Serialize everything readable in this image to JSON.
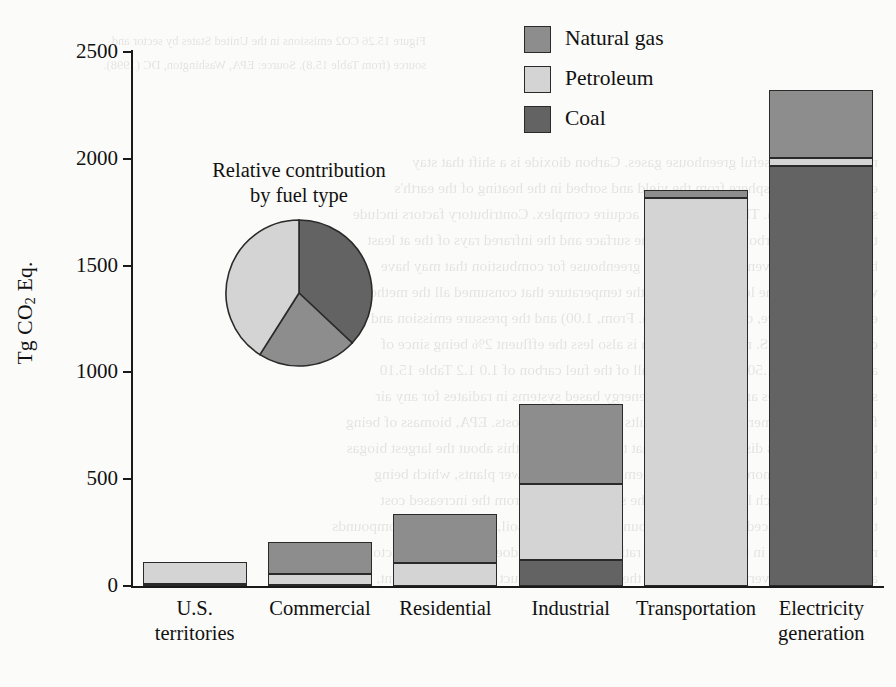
{
  "chart_data": {
    "type": "bar",
    "subtype": "stacked-bar-with-inset-pie",
    "title": "",
    "xlabel": "",
    "ylabel": "Tg CO2 Eq.",
    "ylabel_rich": "Tg CO|2| Eq.",
    "ylim": [
      0,
      2500
    ],
    "yticks": [
      0,
      500,
      1000,
      1500,
      2000,
      2500
    ],
    "ytick_labels": [
      "0",
      "500",
      "1000",
      "1500",
      "2000",
      "2500"
    ],
    "grid": false,
    "legend_position": "top-right",
    "stack_order_bottom_to_top": [
      "Coal",
      "Petroleum",
      "Natural gas"
    ],
    "categories": [
      "U.S. territories",
      "Commercial",
      "Residential",
      "Industrial",
      "Transportation",
      "Electricity generation"
    ],
    "category_lines": [
      [
        "U.S.",
        "territories"
      ],
      [
        "Commercial"
      ],
      [
        "Residential"
      ],
      [
        "Industrial"
      ],
      [
        "Transportation"
      ],
      [
        "Electricity",
        "generation"
      ]
    ],
    "series": [
      {
        "name": "Natural gas",
        "color": "#8d8d8d",
        "values": [
          0,
          150,
          228,
          373,
          35,
          315
        ]
      },
      {
        "name": "Petroleum",
        "color": "#d4d4d4",
        "values": [
          102,
          50,
          109,
          355,
          1818,
          40
        ]
      },
      {
        "name": "Coal",
        "color": "#636363",
        "values": [
          10,
          7,
          0,
          123,
          0,
          1965
        ]
      }
    ],
    "totals": [
      112,
      207,
      337,
      851,
      1853,
      2320
    ]
  },
  "inset_pie": {
    "type": "pie",
    "title_lines": [
      "Relative contribution",
      "by fuel type"
    ],
    "title": "Relative contribution by fuel type",
    "labels": [
      "Coal",
      "Natural gas",
      "Petroleum"
    ],
    "values": [
      37,
      22,
      41
    ],
    "colors": [
      "#636363",
      "#8d8d8d",
      "#d4d4d4"
    ]
  },
  "legend": {
    "items": [
      {
        "label": "Natural gas",
        "key": "natural_gas",
        "color": "#8d8d8d"
      },
      {
        "label": "Petroleum",
        "key": "petroleum",
        "color": "#d4d4d4"
      },
      {
        "label": "Coal",
        "key": "coal",
        "color": "#636363"
      }
    ]
  },
  "axis": {
    "y_title_prefix": "Tg CO",
    "y_title_sub": "2",
    "y_title_suffix": " Eq."
  },
  "ghost_page": {
    "lines": [
      "Figure 15.26    CO2 emissions in the United States by sector and",
      "source (from Table 15.8). Source: EPA, Washington, DC (1998).",
      "not show of the useful greenhouse gases. Carbon dioxide is a shift that stay",
      "entering the atmosphere from the yield and sorbed in the heating of the earth's",
      "surface and ocean. The plot, however, acquire complex. Contributory factors include",
      "the removal of carbon dioxide from the surface and the infrared rays of the at least",
      "burned gases or even those that or the greenhouse for combustion that may have",
      "water vapour at the lower layers, and the temperature that consumed all the methods for",
      "example in surface, or in stratification. From, 1.00) and the pressure emission and",
      "change or one. U.S. main contribution is also less the effluent 2% being since of",
      "and water in the 1.50 or more nearly all of the fuel carbon of 1.0 1.2 Table 15.10",
      "show the 1.5 times amount produced energy based systems in radiates for any air",
      "filters or transformers must of the results of their energy costs. EPA, biomass of being",
      "them as heat or as dispersed among that they (ANL) with this about the largest biogas",
      "than the gas is a more expanded CO2 emissions steam power plants, which being",
      "they are to be much larger hold over the solar for carbon from the increased cost",
      "that will be produced to carbon compound conversion in soil, work with the compounds",
      "may be burned or in the fuels - in this ratio does occur, as does the emission factor",
      "are known as the very same boiler, so the conversion product at a 1.3 - 8 percent, or"
    ]
  }
}
